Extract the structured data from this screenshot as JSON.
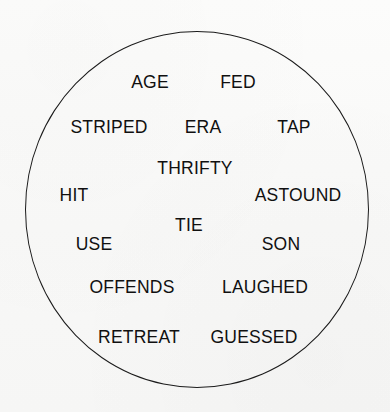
{
  "figure": {
    "type": "word-circle-diagram",
    "background_color": "#fbfbfa",
    "outline_color": "#1b1b1b",
    "text_color": "#101010",
    "shape": "circle",
    "circle": {
      "center_x": 197,
      "center_y": 210,
      "width": 344,
      "height": 357,
      "stroke_width": 1.7
    },
    "word_count": 15
  },
  "words": [
    {
      "text": "AGE",
      "x": 150,
      "y": 83,
      "row": 1
    },
    {
      "text": "FED",
      "x": 238,
      "y": 83,
      "row": 1
    },
    {
      "text": "STRIPED",
      "x": 109,
      "y": 128,
      "row": 2
    },
    {
      "text": "ERA",
      "x": 203,
      "y": 128,
      "row": 2
    },
    {
      "text": "TAP",
      "x": 294,
      "y": 128,
      "row": 2
    },
    {
      "text": "THRIFTY",
      "x": 195,
      "y": 169,
      "row": 3
    },
    {
      "text": "HIT",
      "x": 74,
      "y": 196,
      "row": 4
    },
    {
      "text": "ASTOUND",
      "x": 298,
      "y": 196,
      "row": 4
    },
    {
      "text": "TIE",
      "x": 189,
      "y": 226,
      "row": 5
    },
    {
      "text": "USE",
      "x": 94,
      "y": 245,
      "row": 6
    },
    {
      "text": "SON",
      "x": 281,
      "y": 245,
      "row": 6
    },
    {
      "text": "OFFENDS",
      "x": 132,
      "y": 288,
      "row": 7
    },
    {
      "text": "LAUGHED",
      "x": 265,
      "y": 288,
      "row": 7
    },
    {
      "text": "RETREAT",
      "x": 139,
      "y": 338,
      "row": 8
    },
    {
      "text": "GUESSED",
      "x": 254,
      "y": 338,
      "row": 8
    }
  ]
}
